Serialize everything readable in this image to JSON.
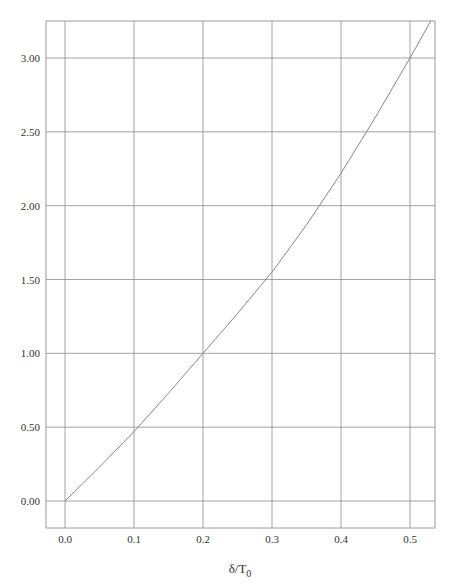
{
  "chart_data": {
    "type": "line",
    "title": "",
    "xlabel": "δ/T0",
    "xlabel_main": "δ/T",
    "xlabel_sub": "0",
    "ylabel": "",
    "xlim": [
      -0.03,
      0.535
    ],
    "ylim": [
      -0.18,
      3.25
    ],
    "grid": true,
    "x_ticks": [
      0.0,
      0.1,
      0.2,
      0.3,
      0.4,
      0.5
    ],
    "x_tick_labels": [
      "0.0",
      "0.1",
      "0.2",
      "0.3",
      "0.4",
      "0.5"
    ],
    "y_ticks": [
      0.0,
      0.5,
      1.0,
      1.5,
      2.0,
      2.5,
      3.0
    ],
    "y_tick_labels": [
      "0.00",
      "0.50",
      "1.00",
      "1.50",
      "2.00",
      "2.50",
      "3.00"
    ],
    "series": [
      {
        "name": "curve",
        "x": [
          0.0,
          0.05,
          0.1,
          0.15,
          0.2,
          0.25,
          0.3,
          0.35,
          0.4,
          0.45,
          0.5,
          0.53
        ],
        "y": [
          0.0,
          0.23,
          0.47,
          0.73,
          1.0,
          1.27,
          1.55,
          1.87,
          2.22,
          2.6,
          3.0,
          3.25
        ]
      }
    ],
    "legend": null
  },
  "colors": {
    "grid": "#8a8a8a",
    "axis_box": "#9a9a9a",
    "curve": "#888888",
    "text": "#333333"
  }
}
